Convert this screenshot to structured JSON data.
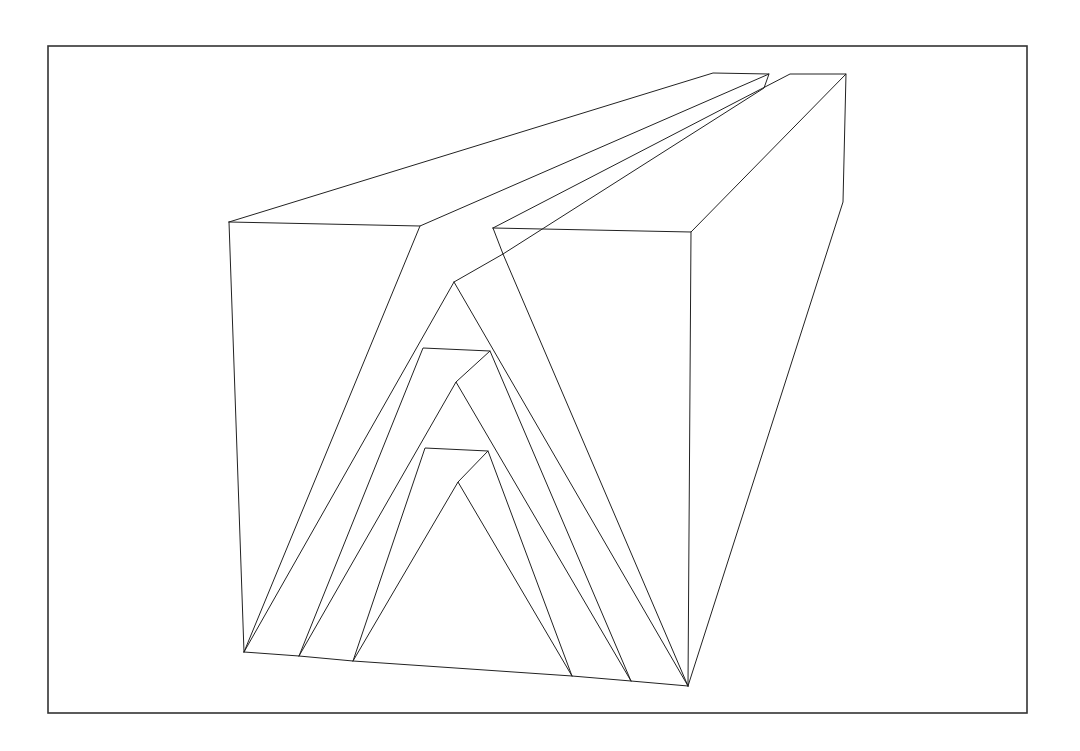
{
  "figure": {
    "colors": {
      "background": "#ffffff",
      "line": "#222222",
      "frame": "#333333"
    },
    "frame": {
      "x1": 48,
      "y1": 46,
      "x2": 1027,
      "y2": 713
    },
    "polylines": [
      {
        "name": "left-block-top-face",
        "points": [
          [
            229,
            222
          ],
          [
            713,
            73
          ],
          [
            769,
            74
          ],
          [
            420,
            226
          ],
          [
            229,
            222
          ]
        ]
      },
      {
        "name": "left-block-front-left-edge",
        "points": [
          [
            229,
            222
          ],
          [
            244,
            652
          ]
        ]
      },
      {
        "name": "left-block-back-notch",
        "points": [
          [
            769,
            74
          ],
          [
            764,
            88
          ],
          [
            503,
            254
          ]
        ]
      },
      {
        "name": "right-block-top-face",
        "points": [
          [
            493,
            228
          ],
          [
            790,
            74
          ],
          [
            846,
            74
          ],
          [
            691,
            232
          ],
          [
            493,
            228
          ]
        ]
      },
      {
        "name": "right-block-side-edge",
        "points": [
          [
            846,
            74
          ],
          [
            843,
            202
          ],
          [
            688,
            686
          ]
        ]
      },
      {
        "name": "right-block-front-right-edge",
        "points": [
          [
            691,
            232
          ],
          [
            688,
            686
          ]
        ]
      },
      {
        "name": "bottom-edge",
        "points": [
          [
            244,
            652
          ],
          [
            299,
            656
          ],
          [
            353,
            661
          ],
          [
            572,
            676
          ],
          [
            631,
            681
          ],
          [
            688,
            686
          ]
        ]
      },
      {
        "name": "outer-arch-left",
        "points": [
          [
            244,
            652
          ],
          [
            420,
            226
          ]
        ]
      },
      {
        "name": "outer-arch-right",
        "points": [
          [
            688,
            686
          ],
          [
            503,
            254
          ],
          [
            493,
            228
          ]
        ]
      },
      {
        "name": "outer-ridge",
        "points": [
          [
            503,
            254
          ],
          [
            454,
            282
          ]
        ]
      },
      {
        "name": "outer-apex-left",
        "points": [
          [
            244,
            652
          ],
          [
            454,
            282
          ]
        ]
      },
      {
        "name": "outer-apex-right",
        "points": [
          [
            688,
            686
          ],
          [
            454,
            282
          ]
        ]
      },
      {
        "name": "middle-arch",
        "points": [
          [
            299,
            656
          ],
          [
            423,
            348
          ],
          [
            490,
            351
          ],
          [
            631,
            681
          ]
        ]
      },
      {
        "name": "middle-ridge",
        "points": [
          [
            490,
            351
          ],
          [
            456,
            382
          ]
        ]
      },
      {
        "name": "middle-apex",
        "points": [
          [
            299,
            656
          ],
          [
            456,
            382
          ],
          [
            631,
            681
          ]
        ]
      },
      {
        "name": "inner-arch",
        "points": [
          [
            353,
            661
          ],
          [
            425,
            448
          ],
          [
            488,
            451
          ],
          [
            572,
            676
          ]
        ]
      },
      {
        "name": "inner-ridge",
        "points": [
          [
            488,
            451
          ],
          [
            458,
            482
          ]
        ]
      },
      {
        "name": "inner-apex",
        "points": [
          [
            353,
            661
          ],
          [
            458,
            482
          ],
          [
            572,
            676
          ]
        ]
      }
    ]
  }
}
